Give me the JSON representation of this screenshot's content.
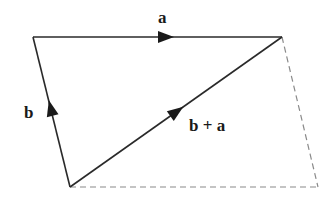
{
  "diagram": {
    "labels": {
      "a": "a",
      "b": "b",
      "sum": "b + a"
    },
    "colors": {
      "solid": "#2a2a2a",
      "dashed": "#8a8a8a",
      "text": "#1a1a1a",
      "background": "#ffffff"
    },
    "vertices": {
      "origin": [
        70,
        187
      ],
      "b_tip": [
        33,
        37
      ],
      "sum_tip": [
        282,
        37
      ],
      "dashed_corner": [
        318,
        187
      ]
    },
    "vectors": [
      {
        "name": "b",
        "from": "origin",
        "to": "b_tip",
        "style": "solid",
        "arrow_at": [
          52,
          110
        ]
      },
      {
        "name": "a",
        "from": "b_tip",
        "to": "sum_tip",
        "style": "solid",
        "arrow_at": [
          166,
          37
        ]
      },
      {
        "name": "b + a",
        "from": "origin",
        "to": "sum_tip",
        "style": "solid",
        "arrow_at": [
          174,
          118
        ]
      }
    ],
    "dashed_edges": [
      {
        "from": "sum_tip",
        "to": "dashed_corner"
      },
      {
        "from": "origin",
        "to": "dashed_corner"
      }
    ]
  }
}
